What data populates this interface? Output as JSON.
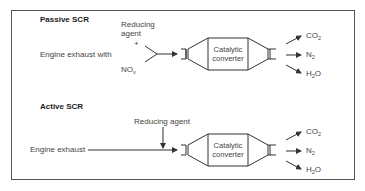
{
  "diagram": {
    "title_passive": "Passive SCR",
    "title_active": "Active SCR",
    "passive": {
      "input_label": "Engine exhaust with",
      "reagent_line1": "Reducing",
      "reagent_line2": "agent",
      "plus": "+",
      "nox": "NO",
      "nox_sub": "x",
      "converter_line1": "Catalytic",
      "converter_line2": "converter",
      "outputs": [
        {
          "main": "CO",
          "sub": "2",
          "after": ""
        },
        {
          "main": "N",
          "sub": "2",
          "after": ""
        },
        {
          "main": "H",
          "sub": "2",
          "after": "O"
        }
      ]
    },
    "active": {
      "input_label": "Engine exhaust",
      "reagent_label": "Reducing agent",
      "converter_line1": "Catalytic",
      "converter_line2": "converter",
      "outputs": [
        {
          "main": "CO",
          "sub": "2",
          "after": ""
        },
        {
          "main": "N",
          "sub": "2",
          "after": ""
        },
        {
          "main": "H",
          "sub": "2",
          "after": "O"
        }
      ]
    },
    "colors": {
      "line": "#333333",
      "text": "#444444",
      "frame": "#555555"
    }
  }
}
